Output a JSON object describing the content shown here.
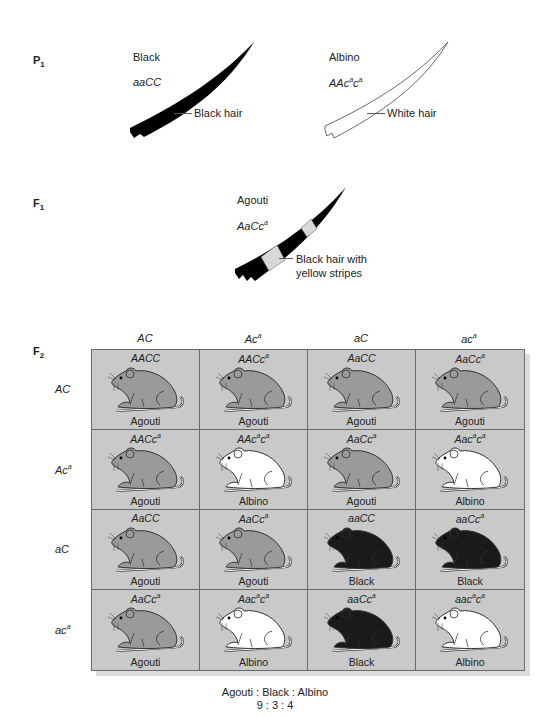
{
  "p1": {
    "label": "P",
    "label_sub": "1",
    "left": {
      "phenotype": "Black",
      "genotype_html": "aaCC",
      "hair_label": "Black hair"
    },
    "right": {
      "phenotype": "Albino",
      "genotype_base": "AAc",
      "genotype_sup1": "a",
      "genotype_mid": "c",
      "genotype_sup2": "a",
      "hair_label": "White hair"
    }
  },
  "f1": {
    "label": "F",
    "label_sub": "1",
    "phenotype": "Agouti",
    "genotype_base": "AaCc",
    "genotype_sup": "a",
    "hair_label_line1": "Black hair with",
    "hair_label_line2": "yellow stripes"
  },
  "f2": {
    "label": "F",
    "label_sub": "2",
    "column_headers": [
      {
        "base": "AC",
        "sup": ""
      },
      {
        "base": "Ac",
        "sup": "a"
      },
      {
        "base": "aC",
        "sup": ""
      },
      {
        "base": "ac",
        "sup": "a"
      }
    ],
    "row_headers": [
      {
        "base": "AC",
        "sup": ""
      },
      {
        "base": "Ac",
        "sup": "a"
      },
      {
        "base": "aC",
        "sup": ""
      },
      {
        "base": "ac",
        "sup": "a"
      }
    ],
    "cells": [
      [
        {
          "genotype": "AACC",
          "phenotype": "Agouti",
          "color": "agouti"
        },
        {
          "genotype": "AACc^a",
          "phenotype": "Agouti",
          "color": "agouti"
        },
        {
          "genotype": "AaCC",
          "phenotype": "Agouti",
          "color": "agouti"
        },
        {
          "genotype": "AaCc^a",
          "phenotype": "Agouti",
          "color": "agouti"
        }
      ],
      [
        {
          "genotype": "AACc^a",
          "phenotype": "Agouti",
          "color": "agouti"
        },
        {
          "genotype": "AAc^ac^a",
          "phenotype": "Albino",
          "color": "albino"
        },
        {
          "genotype": "AaCc^a",
          "phenotype": "Agouti",
          "color": "agouti"
        },
        {
          "genotype": "Aac^ac^a",
          "phenotype": "Albino",
          "color": "albino"
        }
      ],
      [
        {
          "genotype": "AaCC",
          "phenotype": "Agouti",
          "color": "agouti"
        },
        {
          "genotype": "AaCc^a",
          "phenotype": "Agouti",
          "color": "agouti"
        },
        {
          "genotype": "aaCC",
          "phenotype": "Black",
          "color": "black"
        },
        {
          "genotype": "aaCc^a",
          "phenotype": "Black",
          "color": "black"
        }
      ],
      [
        {
          "genotype": "AaCc^a",
          "phenotype": "Agouti",
          "color": "agouti"
        },
        {
          "genotype": "Aac^ac^a",
          "phenotype": "Albino",
          "color": "albino"
        },
        {
          "genotype": "aaCc^a",
          "phenotype": "Black",
          "color": "black"
        },
        {
          "genotype": "aac^ac^a",
          "phenotype": "Albino",
          "color": "albino"
        }
      ]
    ],
    "mouse_colors": {
      "agouti": "#9a9a9a",
      "albino": "#ffffff",
      "black": "#1a1a1a"
    },
    "grid_background": "#c9c9c9"
  },
  "ratio": {
    "labels": "Agouti : Black : Albino",
    "values": "9 : 3 : 4"
  }
}
